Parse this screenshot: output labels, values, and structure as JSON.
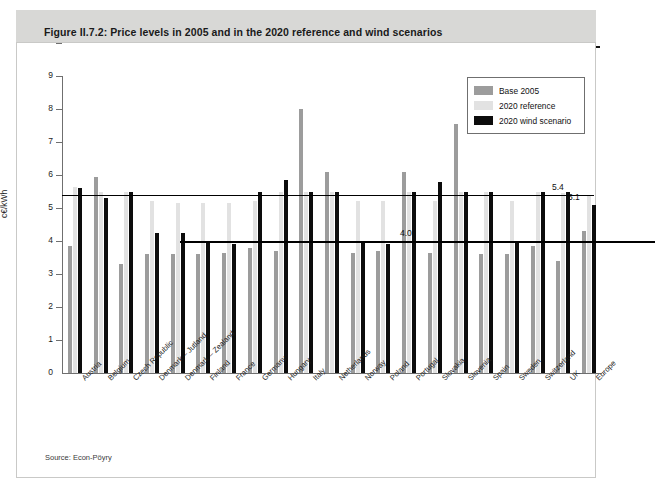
{
  "figure": {
    "title": "Figure II.7.2: Price levels in 2005 and in the 2020 reference and wind scenarios",
    "source": "Source: Econ-Pöyry"
  },
  "legend": {
    "position": "top-right",
    "items": [
      {
        "label": "Base 2005",
        "color": "#9c9c9c",
        "icon": "legend-swatch-base"
      },
      {
        "label": "2020 reference",
        "color": "#e2e2e2",
        "icon": "legend-swatch-reference"
      },
      {
        "label": "2020 wind scenario",
        "color": "#0c0c0c",
        "icon": "legend-swatch-wind"
      }
    ]
  },
  "chart_data": {
    "type": "bar",
    "title": "Price levels in 2005 and in the 2020 reference and wind scenarios",
    "xlabel": "",
    "ylabel": "c€/kWh",
    "ylim": [
      0,
      9
    ],
    "yticks": [
      0,
      1,
      2,
      3,
      4,
      5,
      6,
      7,
      8,
      9
    ],
    "grid": false,
    "categories": [
      "Austria",
      "Belgium",
      "Czech Republic",
      "Denmark – Jutland",
      "Denmark – Zealand",
      "Finland",
      "France",
      "Germany",
      "Hungary",
      "Italy",
      "Netherlands",
      "Norway",
      "Poland",
      "Portugal",
      "Slovakia",
      "Slovenia",
      "Spain",
      "Sweden",
      "Switzerland",
      "UK",
      "Europe"
    ],
    "series": [
      {
        "name": "Base 2005",
        "color": "#9c9c9c",
        "values": [
          3.85,
          5.95,
          3.3,
          3.6,
          3.6,
          3.6,
          3.65,
          3.8,
          3.7,
          8.0,
          6.1,
          3.65,
          3.7,
          6.1,
          3.65,
          7.55,
          3.6,
          3.6,
          3.85,
          3.4,
          4.3
        ]
      },
      {
        "name": "2020 reference",
        "color": "#e2e2e2",
        "values": [
          5.65,
          5.5,
          5.5,
          5.2,
          5.15,
          5.15,
          5.15,
          5.2,
          5.5,
          5.5,
          5.5,
          5.2,
          5.2,
          5.5,
          5.2,
          5.5,
          5.5,
          5.2,
          5.5,
          5.45,
          5.4
        ]
      },
      {
        "name": "2020 wind scenario",
        "color": "#0c0c0c",
        "values": [
          5.6,
          5.3,
          5.5,
          4.25,
          4.25,
          4.0,
          3.9,
          5.5,
          5.85,
          5.5,
          5.5,
          4.0,
          3.9,
          5.5,
          5.8,
          5.5,
          5.5,
          4.0,
          5.5,
          5.5,
          5.1
        ]
      }
    ],
    "reference_lines": [
      {
        "value": 5.4,
        "label": "5.4",
        "color": "#000000"
      },
      {
        "value": 4.0,
        "label": "4.0",
        "color": "#000000"
      }
    ],
    "annotations": [
      {
        "label": "5.4",
        "value": 5.4,
        "target": "reference-line-upper"
      },
      {
        "label": "4.0",
        "value": 4.0,
        "target": "reference-line-lower"
      },
      {
        "label": "5.1",
        "value": 5.1,
        "target": "europe-wind-bar"
      }
    ]
  }
}
